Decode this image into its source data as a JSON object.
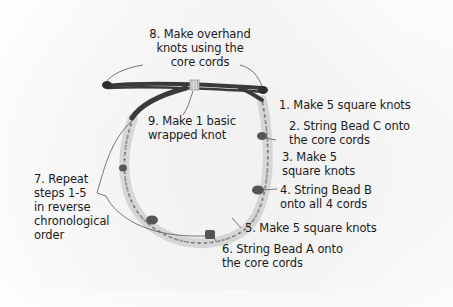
{
  "diagram": {
    "colors": {
      "background": "#f7f7f7",
      "cord_dark": "#3a3a3a",
      "cord_light": "#d8d8d8",
      "bead": "#5a5a5a",
      "leader_line": "#555555",
      "text": "#1b1b1b"
    },
    "labels": [
      {
        "id": "step-8",
        "lines": [
          "8. Make overhand",
          "knots using the",
          "core cords"
        ]
      },
      {
        "id": "step-9",
        "lines": [
          "9. Make 1 basic",
          "wrapped knot"
        ]
      },
      {
        "id": "step-1",
        "lines": [
          "1. Make 5 square knots"
        ]
      },
      {
        "id": "step-2",
        "lines": [
          "2. String Bead C onto",
          "the core cords"
        ]
      },
      {
        "id": "step-3",
        "lines": [
          "3. Make 5",
          "square knots"
        ]
      },
      {
        "id": "step-4",
        "lines": [
          "4. String Bead B",
          "onto all 4 cords"
        ]
      },
      {
        "id": "step-5",
        "lines": [
          "5. Make 5 square knots"
        ]
      },
      {
        "id": "step-6",
        "lines": [
          "6. String Bead A onto",
          "the core cords"
        ]
      },
      {
        "id": "step-7",
        "lines": [
          "7. Repeat",
          "steps 1-5",
          "in reverse",
          "chronological",
          "order"
        ]
      }
    ]
  }
}
